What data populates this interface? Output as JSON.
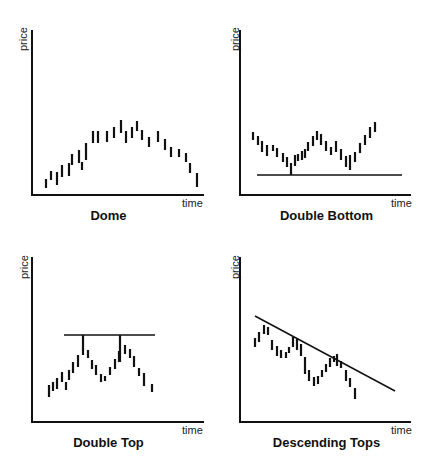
{
  "panels": [
    {
      "title": "Dome",
      "ylabel": "price",
      "xlabel": "time"
    },
    {
      "title": "Double Bottom",
      "ylabel": "price",
      "xlabel": "time"
    },
    {
      "title": "Double Top",
      "ylabel": "price",
      "xlabel": "time"
    },
    {
      "title": "Descending Tops",
      "ylabel": "price",
      "xlabel": "time"
    }
  ],
  "chart_data": [
    {
      "type": "bar-range",
      "title": "Dome",
      "xlabel": "time",
      "ylabel": "price",
      "description": "Price bars rise gradually to a rounded peak then decline symmetrically",
      "bars": [
        [
          46,
          188,
          179
        ],
        [
          51,
          180,
          171
        ],
        [
          57,
          185,
          172
        ],
        [
          62,
          177,
          165
        ],
        [
          69,
          176,
          163
        ],
        [
          72,
          165,
          154
        ],
        [
          79,
          163,
          150
        ],
        [
          82,
          170,
          162
        ],
        [
          86,
          160,
          143
        ],
        [
          93,
          143,
          131
        ],
        [
          98,
          143,
          131
        ],
        [
          107,
          142,
          131
        ],
        [
          114,
          138,
          127
        ],
        [
          121,
          133,
          120
        ],
        [
          126,
          143,
          131
        ],
        [
          132,
          138,
          127
        ],
        [
          137,
          131,
          121
        ],
        [
          142,
          140,
          130
        ],
        [
          149,
          147,
          137
        ],
        [
          158,
          142,
          131
        ],
        [
          165,
          150,
          139
        ],
        [
          171,
          157,
          147
        ],
        [
          179,
          157,
          149
        ],
        [
          186,
          162,
          153
        ],
        [
          190,
          173,
          163
        ],
        [
          197,
          187,
          173
        ]
      ],
      "grid": false,
      "legend": null
    },
    {
      "type": "bar-range",
      "title": "Double Bottom",
      "xlabel": "time",
      "ylabel": "price",
      "support_line": {
        "x1": 257,
        "x2": 402,
        "y": 175
      },
      "bars": [
        [
          253,
          140,
          132
        ],
        [
          258,
          145,
          136
        ],
        [
          262,
          152,
          141
        ],
        [
          267,
          156,
          145
        ],
        [
          273,
          151,
          145
        ],
        [
          277,
          157,
          148
        ],
        [
          283,
          162,
          153
        ],
        [
          287,
          167,
          157
        ],
        [
          291,
          175,
          163
        ],
        [
          295,
          166,
          155
        ],
        [
          298,
          161,
          154
        ],
        [
          302,
          160,
          151
        ],
        [
          305,
          158,
          149
        ],
        [
          308,
          151,
          142
        ],
        [
          313,
          146,
          136
        ],
        [
          317,
          140,
          131
        ],
        [
          321,
          145,
          134
        ],
        [
          326,
          151,
          141
        ],
        [
          331,
          155,
          147
        ],
        [
          336,
          152,
          141
        ],
        [
          341,
          160,
          149
        ],
        [
          346,
          167,
          156
        ],
        [
          350,
          170,
          155
        ],
        [
          355,
          162,
          152
        ],
        [
          360,
          153,
          143
        ],
        [
          365,
          145,
          135
        ],
        [
          370,
          138,
          127
        ],
        [
          375,
          132,
          122
        ]
      ],
      "grid": false,
      "legend": null
    },
    {
      "type": "bar-range",
      "title": "Double Top",
      "xlabel": "time",
      "ylabel": "price",
      "resistance_line": {
        "x1": 64,
        "x2": 155,
        "y": 335
      },
      "bars": [
        [
          49,
          397,
          385
        ],
        [
          53,
          391,
          382
        ],
        [
          57,
          389,
          378
        ],
        [
          62,
          382,
          372
        ],
        [
          66,
          390,
          382
        ],
        [
          69,
          380,
          370
        ],
        [
          73,
          373,
          362
        ],
        [
          78,
          367,
          355
        ],
        [
          83,
          335,
          355
        ],
        [
          88,
          358,
          350
        ],
        [
          92,
          369,
          360
        ],
        [
          96,
          375,
          365
        ],
        [
          101,
          382,
          374
        ],
        [
          105,
          381,
          376
        ],
        [
          110,
          375,
          367
        ],
        [
          115,
          369,
          359
        ],
        [
          119,
          362,
          351
        ],
        [
          120,
          335,
          362
        ],
        [
          125,
          354,
          345
        ],
        [
          130,
          358,
          349
        ],
        [
          134,
          367,
          356
        ],
        [
          139,
          376,
          368
        ],
        [
          144,
          386,
          373
        ],
        [
          152,
          392,
          384
        ]
      ],
      "grid": false,
      "legend": null
    },
    {
      "type": "bar-range",
      "title": "Descending Tops",
      "xlabel": "time",
      "ylabel": "price",
      "trend_line": {
        "x1": 255,
        "y1": 316,
        "x2": 395,
        "y2": 391
      },
      "bars": [
        [
          255,
          347,
          338
        ],
        [
          259,
          342,
          332
        ],
        [
          264,
          334,
          325
        ],
        [
          268,
          335,
          327
        ],
        [
          272,
          350,
          340
        ],
        [
          277,
          356,
          346
        ],
        [
          281,
          358,
          350
        ],
        [
          286,
          358,
          352
        ],
        [
          289,
          353,
          347
        ],
        [
          293,
          347,
          337
        ],
        [
          297,
          350,
          339
        ],
        [
          301,
          356,
          344
        ],
        [
          305,
          374,
          357
        ],
        [
          309,
          381,
          370
        ],
        [
          314,
          386,
          377
        ],
        [
          318,
          384,
          376
        ],
        [
          322,
          377,
          370
        ],
        [
          326,
          372,
          364
        ],
        [
          330,
          367,
          358
        ],
        [
          334,
          362,
          356
        ],
        [
          337,
          366,
          354
        ],
        [
          341,
          368,
          361
        ],
        [
          346,
          381,
          370
        ],
        [
          350,
          387,
          378
        ],
        [
          355,
          399,
          388
        ]
      ],
      "grid": false,
      "legend": null
    }
  ]
}
